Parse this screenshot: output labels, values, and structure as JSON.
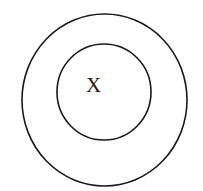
{
  "diagram": {
    "type": "concentric-circles",
    "outer_circle": {
      "cx": 104.5,
      "cy": 100,
      "rx": 82.5,
      "ry": 86
    },
    "inner_circle": {
      "cx": 104,
      "cy": 92,
      "rx": 47,
      "ry": 48
    },
    "label": {
      "text": "X",
      "x": 93.5,
      "y": 92
    },
    "stroke_color": "#1a1a1a",
    "background": "#ffffff"
  }
}
